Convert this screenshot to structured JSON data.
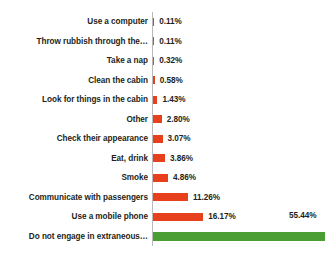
{
  "chart_data": {
    "type": "bar",
    "orientation": "horizontal",
    "title": "",
    "xlabel": "",
    "ylabel": "",
    "grid": false,
    "legend": false,
    "axis_line_visible": true,
    "value_suffix": "%",
    "xlim": [
      0,
      55.44
    ],
    "categories": [
      "Use a computer",
      "Throw rubbish through the…",
      "Take a nap",
      "Clean the cabin",
      "Look for things in the cabin",
      "Other",
      "Check their appearance",
      "Eat, drink",
      "Smoke",
      "Communicate with passengers",
      "Use a mobile phone",
      "Do not engage in extraneous…"
    ],
    "values": [
      0.11,
      0.11,
      0.32,
      0.58,
      1.43,
      2.8,
      3.07,
      3.86,
      4.86,
      11.26,
      16.17,
      55.44
    ],
    "value_labels": [
      "0.11%",
      "0.11%",
      "0.32%",
      "0.58%",
      "1.43%",
      "2.80%",
      "3.07%",
      "3.86%",
      "4.86%",
      "11.26%",
      "16.17%",
      "55.44%"
    ],
    "bar_colors": [
      "#e8401c",
      "#e8401c",
      "#e8401c",
      "#e8401c",
      "#e8401c",
      "#e8401c",
      "#e8401c",
      "#e8401c",
      "#e8401c",
      "#e8401c",
      "#e8401c",
      "#4a9e34"
    ],
    "colors": {
      "bar_primary": "#e8401c",
      "bar_highlight": "#4a9e34",
      "text": "#231f20",
      "axis": "#b9b9b9",
      "background": "#ffffff"
    }
  }
}
